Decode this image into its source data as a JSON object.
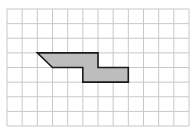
{
  "diagram": {
    "type": "grid-shape",
    "grid": {
      "columns": 12,
      "rows": 8,
      "origin_px": [
        7,
        9
      ],
      "size_px": [
        182,
        117
      ],
      "line_color": "#c8c8c8",
      "background": "#ffffff"
    },
    "shape": {
      "vertices_grid": [
        [
          2,
          3
        ],
        [
          6,
          3
        ],
        [
          6,
          4
        ],
        [
          8,
          4
        ],
        [
          8,
          5
        ],
        [
          5,
          5
        ],
        [
          5,
          4
        ],
        [
          3,
          4
        ]
      ],
      "fill": "#bdbdbd",
      "stroke": "#1a1a1a",
      "stroke_width": 1.6
    }
  }
}
